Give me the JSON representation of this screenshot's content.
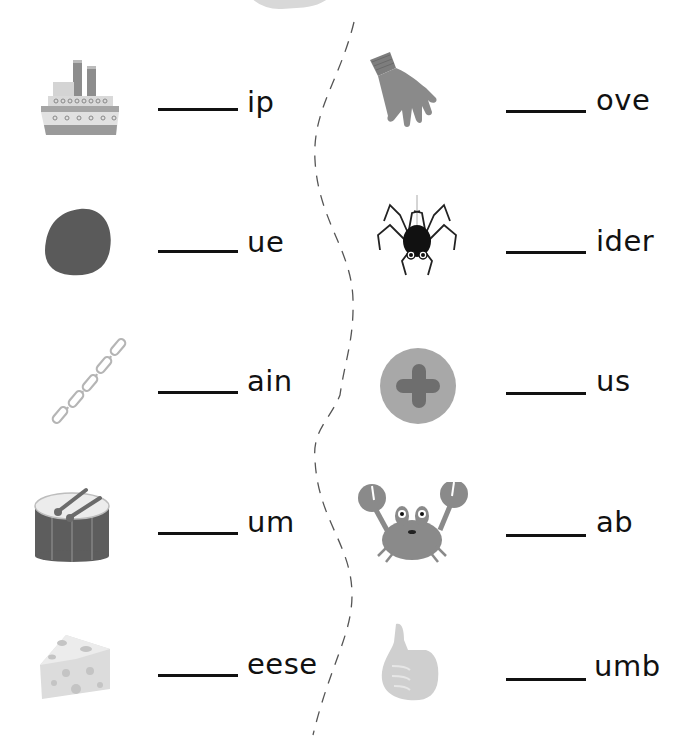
{
  "worksheet": {
    "left_column": [
      {
        "picture": "ship",
        "suffix": "ip"
      },
      {
        "picture": "blue-blob",
        "suffix": "ue"
      },
      {
        "picture": "chain",
        "suffix": "ain"
      },
      {
        "picture": "drum",
        "suffix": "um"
      },
      {
        "picture": "cheese",
        "suffix": "eese"
      }
    ],
    "right_column": [
      {
        "picture": "glove",
        "suffix": "ove"
      },
      {
        "picture": "spider",
        "suffix": "ider"
      },
      {
        "picture": "plus",
        "suffix": "us"
      },
      {
        "picture": "crab",
        "suffix": "ab"
      },
      {
        "picture": "thumb",
        "suffix": "umb"
      }
    ],
    "blank_placeholder": "_____"
  },
  "colors": {
    "text": "#111111",
    "picture_gray": "#8a8a8a",
    "dashed_divider": "#555555"
  }
}
